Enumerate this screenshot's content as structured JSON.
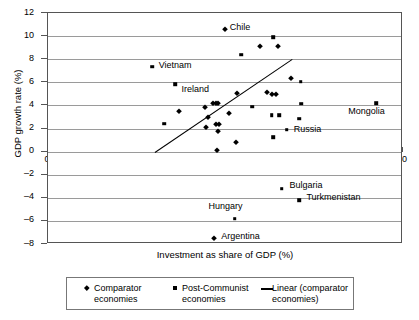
{
  "chart_data": {
    "type": "scatter",
    "title": "",
    "xlabel": "Investment as share of GDP (%)",
    "ylabel": "GDP growth rate (%)",
    "xlim": [
      0,
      50
    ],
    "ylim": [
      -8,
      12
    ],
    "xticks": [
      0,
      5,
      10,
      15,
      20,
      25,
      30,
      35,
      40,
      45,
      50
    ],
    "yticks": [
      -8,
      -6,
      -4,
      -2,
      0,
      2,
      4,
      6,
      8,
      10,
      12
    ],
    "grid": "horizontal",
    "legend_position": "bottom",
    "series": [
      {
        "name": "Comparator economies",
        "marker": "diamond",
        "points": [
          [
            18.4,
            3.55
          ],
          [
            22.1,
            3.9
          ],
          [
            22.6,
            3.0
          ],
          [
            22.2,
            2.15
          ],
          [
            23.2,
            4.25
          ],
          [
            23.6,
            4.25
          ],
          [
            23.9,
            4.25
          ],
          [
            23.6,
            2.4
          ],
          [
            24.1,
            2.4
          ],
          [
            23.9,
            1.8
          ],
          [
            23.8,
            0.15
          ],
          [
            24.9,
            10.6
          ],
          [
            25.5,
            3.3
          ],
          [
            26.6,
            5.1
          ],
          [
            26.5,
            0.8
          ],
          [
            29.8,
            9.1
          ],
          [
            30.9,
            5.15
          ],
          [
            31.6,
            5.0
          ],
          [
            32.1,
            5.0
          ],
          [
            32.4,
            9.1
          ],
          [
            34.2,
            6.4
          ],
          [
            23.4,
            -7.5
          ]
        ]
      },
      {
        "name": "Post-Communist economies",
        "marker": "square",
        "points": [
          [
            16.4,
            2.4
          ],
          [
            17.9,
            5.85
          ],
          [
            14.7,
            7.35
          ],
          [
            27.2,
            8.4
          ],
          [
            28.8,
            3.9
          ],
          [
            31.7,
            9.9
          ],
          [
            31.5,
            3.15
          ],
          [
            32.6,
            3.15
          ],
          [
            33.6,
            1.9
          ],
          [
            31.7,
            1.25
          ],
          [
            35.6,
            6.05
          ],
          [
            35.7,
            4.15
          ],
          [
            35.4,
            2.85
          ],
          [
            46.2,
            4.2
          ],
          [
            26.3,
            -5.8
          ],
          [
            32.9,
            -3.2
          ],
          [
            35.4,
            -4.2
          ]
        ]
      }
    ],
    "trendline": {
      "name": "Linear (comparator economies)",
      "x0": 15.1,
      "y0": -0.05,
      "x1": 34.4,
      "y1": 8.0
    },
    "annotations": [
      {
        "text": "Chile",
        "x": 25.6,
        "y": 10.75,
        "anchor": "left"
      },
      {
        "text": "Vietnam",
        "x": 15.6,
        "y": 7.45,
        "anchor": "left"
      },
      {
        "text": "Ireland",
        "x": 18.8,
        "y": 5.35,
        "anchor": "left"
      },
      {
        "text": "Mongolia",
        "x": 42.3,
        "y": 3.45,
        "anchor": "left"
      },
      {
        "text": "Russia",
        "x": 34.6,
        "y": 1.95,
        "anchor": "left"
      },
      {
        "text": "Bulgaria",
        "x": 34.0,
        "y": -2.9,
        "anchor": "left"
      },
      {
        "text": "Turkmenistan",
        "x": 36.4,
        "y": -4.0,
        "anchor": "left"
      },
      {
        "text": "Hungary",
        "x": 22.6,
        "y": -4.75,
        "anchor": "left"
      },
      {
        "text": "Argentina",
        "x": 24.4,
        "y": -7.35,
        "anchor": "left"
      }
    ]
  },
  "legend": {
    "entries": [
      {
        "marker": "diamond",
        "line1": "Comparator",
        "line2": "economies"
      },
      {
        "marker": "square",
        "line1": "Post-Communist",
        "line2": "economies"
      },
      {
        "marker": "line",
        "line1": "Linear (comparator",
        "line2": "economies)"
      }
    ]
  }
}
